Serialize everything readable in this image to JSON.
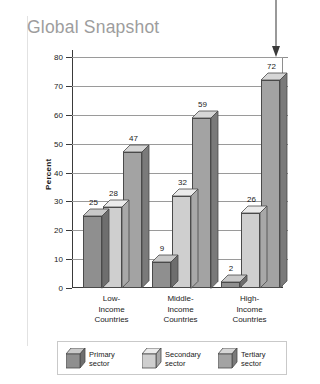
{
  "title": "Global Snapshot",
  "colors": {
    "primary": "#8f8f8f",
    "primary_top": "#c9c9c9",
    "primary_side": "#6e6e6e",
    "secondary": "#cfcfcf",
    "secondary_top": "#ebebeb",
    "secondary_side": "#a8a8a8",
    "tertiary": "#a3a3a3",
    "tertiary_top": "#d6d6d6",
    "tertiary_side": "#7a7a7a",
    "title": "#9d9d9d",
    "axis": "#3a3a3a",
    "grid": "#9a9a9a"
  },
  "annotation": {
    "arrow": "down-arrow-callout"
  },
  "chart_data": {
    "type": "bar",
    "title": "Global Snapshot",
    "xlabel": "",
    "ylabel": "Percent",
    "ylim": [
      0,
      80
    ],
    "ytick_step": 10,
    "yticks": [
      0,
      10,
      20,
      30,
      40,
      50,
      60,
      70,
      80
    ],
    "grid": true,
    "legend_position": "bottom",
    "categories": [
      "Low-\nIncome\nCountries",
      "Middle-\nIncome\nCountries",
      "High-\nIncome\nCountries"
    ],
    "category_lines": [
      [
        "Low-",
        "Income",
        "Countries"
      ],
      [
        "Middle-",
        "Income",
        "Countries"
      ],
      [
        "High-",
        "Income",
        "Countries"
      ]
    ],
    "series": [
      {
        "name": "Primary sector",
        "values": [
          25,
          9,
          2
        ]
      },
      {
        "name": "Secondary sector",
        "values": [
          28,
          32,
          26
        ]
      },
      {
        "name": "Tertiary sector",
        "values": [
          47,
          59,
          72
        ]
      }
    ]
  },
  "legend": [
    {
      "label_line1": "Primary",
      "label_line2": "sector"
    },
    {
      "label_line1": "Secondary",
      "label_line2": "sector"
    },
    {
      "label_line1": "Tertiary",
      "label_line2": "sector"
    }
  ],
  "yticks_text": [
    "0",
    "10",
    "20",
    "30",
    "40",
    "50",
    "60",
    "70",
    "80"
  ]
}
